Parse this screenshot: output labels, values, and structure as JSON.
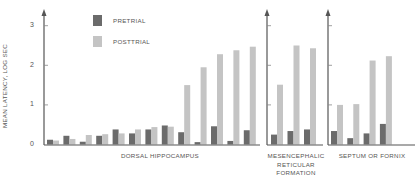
{
  "chart_data": {
    "type": "bar",
    "title": "",
    "ylabel": "MEAN LATENCY, LOG SEC",
    "ylim": [
      0,
      3.3
    ],
    "yticks": [
      0,
      1,
      2,
      3
    ],
    "grid": false,
    "legend": {
      "position": "top-left inside",
      "entries": [
        "PRETRIAL",
        "POSTTRIAL"
      ]
    },
    "colors": {
      "PRETRIAL": "#6b6b6b",
      "POSTTRIAL": "#c4c4c4",
      "axis": "#555555"
    },
    "panels": [
      {
        "xlabel": "DORSAL HIPPOCAMPUS",
        "categories": [
          "1",
          "2",
          "3",
          "4",
          "5",
          "6",
          "7",
          "8",
          "9",
          "10",
          "11",
          "12",
          "13"
        ],
        "series": [
          {
            "name": "PRETRIAL",
            "values": [
              0.12,
              0.22,
              0.07,
              0.22,
              0.38,
              0.28,
              0.38,
              0.48,
              0.31,
              0.06,
              0.46,
              0.09,
              0.36
            ]
          },
          {
            "name": "POSTTRIAL",
            "values": [
              0.1,
              0.14,
              0.24,
              0.26,
              0.28,
              0.38,
              0.44,
              0.45,
              1.5,
              1.95,
              2.28,
              2.38,
              2.47
            ]
          }
        ]
      },
      {
        "xlabel": "MESENCEPHALIC RETICULAR FORMATION",
        "categories": [
          "1",
          "2",
          "3"
        ],
        "series": [
          {
            "name": "PRETRIAL",
            "values": [
              0.25,
              0.34,
              0.38
            ]
          },
          {
            "name": "POSTTRIAL",
            "values": [
              1.51,
              2.5,
              2.43
            ]
          }
        ]
      },
      {
        "xlabel": "SEPTUM OR FORNIX",
        "categories": [
          "1",
          "2",
          "3",
          "4"
        ],
        "series": [
          {
            "name": "PRETRIAL",
            "values": [
              0.34,
              0.16,
              0.28,
              0.52
            ]
          },
          {
            "name": "POSTTRIAL",
            "values": [
              1.0,
              1.02,
              2.12,
              2.23
            ]
          }
        ]
      }
    ]
  },
  "labels": {
    "ylabel": "MEAN LATENCY, LOG SEC",
    "ticks": [
      "0",
      "1",
      "2",
      "3"
    ],
    "legend_pre": "PRETRIAL",
    "legend_post": "POSTTRIAL",
    "panel1": "DORSAL HIPPOCAMPUS",
    "panel2_line1": "MESENCEPHALIC",
    "panel2_line2": "RETICULAR",
    "panel2_line3": "FORMATION",
    "panel3": "SEPTUM OR FORNIX"
  }
}
